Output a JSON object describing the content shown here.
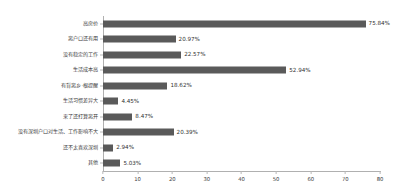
{
  "chart_data": {
    "type": "bar",
    "orientation": "horizontal",
    "title": "",
    "subtitle": "",
    "xlabel": "",
    "ylabel": "",
    "xlim": [
      0,
      80
    ],
    "xticks": [
      "0",
      "10",
      "20",
      "30",
      "40",
      "50",
      "60",
      "70",
      "80"
    ],
    "grid": false,
    "legend": false,
    "bar_color": "#5a5a5a",
    "axis_color": "#b0b0b0",
    "value_label_suffix": "%",
    "categories": [
      "高房价",
      "离户口还有用",
      "没有稳定的工作",
      "生活成本高",
      "有背离乡·根提醒",
      "生活习惯差异大",
      "来了还打算离开",
      "没有深圳户口对生活、工作影响不大",
      "还不太喜欢深圳",
      "其他"
    ],
    "values": [
      75.84,
      20.97,
      22.57,
      52.94,
      18.62,
      4.45,
      8.47,
      20.39,
      2.94,
      5.03
    ],
    "value_labels": [
      "75.84%",
      "20.97%",
      "22.57%",
      "52.94%",
      "18.62%",
      "4.45%",
      "8.47%",
      "20.39%",
      "2.94%",
      "5.03%"
    ]
  }
}
